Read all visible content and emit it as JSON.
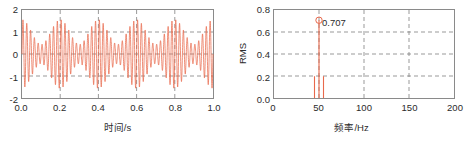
{
  "figure": {
    "panels": [
      {
        "id": "time-waveform",
        "xlabel": "时间/s",
        "ylabel": "",
        "xticks": [
          "0.0",
          "0.2",
          "0.4",
          "0.6",
          "0.8",
          "1.0"
        ],
        "yticks": [
          "2",
          "1",
          "0",
          "-1",
          "-2"
        ]
      },
      {
        "id": "rms-spectrum",
        "xlabel": "频率/Hz",
        "ylabel": "RMS",
        "xticks": [
          "0",
          "50",
          "100",
          "150",
          "200"
        ],
        "yticks": [
          "0.8",
          "0.6",
          "0.4",
          "0.2",
          "0.0"
        ],
        "annotation": "0.707"
      }
    ],
    "colors": {
      "trace": "#e8694c",
      "marker": "#e8694c",
      "axis": "#8a8a8a",
      "grid": "#6f6f6f",
      "text": "#2b2b2b",
      "background": "#ffffff"
    }
  },
  "chart_data": [
    {
      "type": "line",
      "id": "time-waveform",
      "title": "",
      "xlabel": "时间/s",
      "ylabel": "",
      "xlim": [
        0.0,
        1.0
      ],
      "ylim": [
        -2,
        2
      ],
      "xticks": [
        0.0,
        0.2,
        0.4,
        0.6,
        0.8,
        1.0
      ],
      "yticks": [
        -2,
        -1,
        0,
        1,
        2
      ],
      "grid": true,
      "grid_style": "dashed",
      "legend": "none",
      "description": "Amplitude-modulated (beating) time signal: 50 Hz carrier modulated by a ~5 Hz envelope; envelope peaks near t = 0.05, 0.25, 0.45, 0.65, 0.85 s with peak amplitude ~1.4 and nodes near t = 0.15, 0.35, 0.55, 0.75, 0.95 s with amplitude ~0.45.",
      "signal_model": {
        "carrier_freq_hz": 50,
        "sideband_freqs_hz": [
          45,
          55
        ],
        "carrier_amplitude": 1.0,
        "sideband_amplitude": 0.28,
        "sample_rate_hz": 2000,
        "duration_s": 1.0
      },
      "envelope_peaks_t": [
        0.05,
        0.25,
        0.45,
        0.65,
        0.85
      ],
      "envelope_peak_value": 1.42,
      "envelope_node_value": 0.46
    },
    {
      "type": "bar",
      "id": "rms-spectrum",
      "title": "",
      "xlabel": "频率/Hz",
      "ylabel": "RMS",
      "xlim": [
        0,
        200
      ],
      "ylim": [
        0.0,
        0.8
      ],
      "xticks": [
        0,
        50,
        100,
        150,
        200
      ],
      "yticks": [
        0.0,
        0.2,
        0.4,
        0.6,
        0.8
      ],
      "grid": true,
      "grid_style": "dashed",
      "legend": "none",
      "categories": [
        45,
        50,
        55
      ],
      "values": [
        0.198,
        0.707,
        0.198
      ],
      "data_labels": [
        null,
        "0.707",
        null
      ],
      "markers": [
        {
          "x": 50,
          "y": 0.707,
          "shape": "circle",
          "filled": false
        }
      ]
    }
  ]
}
